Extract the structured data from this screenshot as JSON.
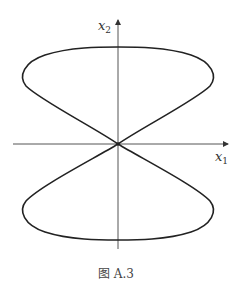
{
  "figure": {
    "caption": "图 A.3",
    "x_axis_label": "x",
    "x_axis_sub": "1",
    "y_axis_label": "x",
    "y_axis_sub": "2"
  },
  "colors": {
    "curve": "#222222",
    "axis": "#555555",
    "background": "#ffffff"
  }
}
